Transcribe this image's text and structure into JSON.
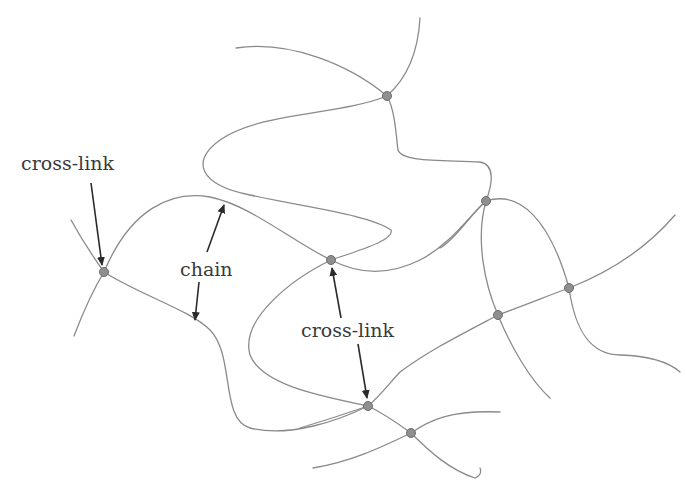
{
  "diagram": {
    "labels": {
      "crosslink_left": "cross-link",
      "chain": "chain",
      "crosslink_center": "cross-link"
    },
    "colors": {
      "chain_stroke": "#8a8a8a",
      "node_fill": "#8f8f8f",
      "arrow": "#2b2b2b",
      "text": "#3a3a3a"
    },
    "nodes": [
      {
        "id": "n1",
        "x": 104,
        "y": 272
      },
      {
        "id": "n2",
        "x": 387,
        "y": 96
      },
      {
        "id": "n3",
        "x": 331,
        "y": 260
      },
      {
        "id": "n4",
        "x": 486,
        "y": 201
      },
      {
        "id": "n5",
        "x": 569,
        "y": 288
      },
      {
        "id": "n6",
        "x": 498,
        "y": 315
      },
      {
        "id": "n7",
        "x": 368,
        "y": 406
      },
      {
        "id": "n8",
        "x": 411,
        "y": 433
      }
    ]
  }
}
